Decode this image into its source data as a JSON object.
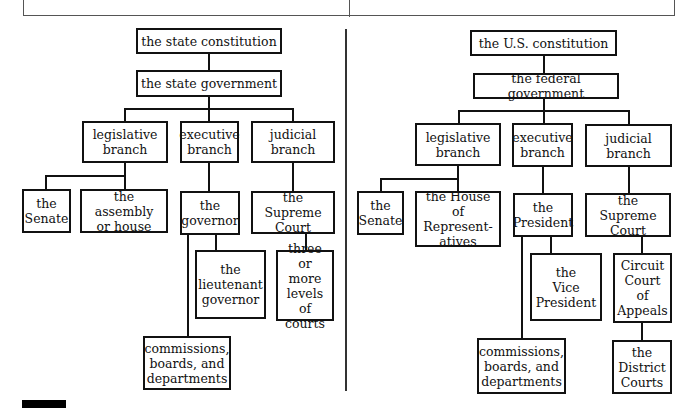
{
  "diagrams": {
    "state": {
      "constitution": "the state constitution",
      "government": "the state government",
      "legislative": "legislative\nbranch",
      "executive": "executive\nbranch",
      "judicial": "judicial\nbranch",
      "senate": "the\nSenate",
      "house": "the assembly\nor house",
      "chief": "the\ngovernor",
      "deputy": "the\nlieutenant\ngovernor",
      "commissions": "commissions,\nboards, and\ndepartments",
      "supreme": "the Supreme\nCourt",
      "lower_courts": "three\nor more\nlevels of\ncourts"
    },
    "federal": {
      "constitution": "the U.S. constitution",
      "government": "the federal government",
      "legislative": "legislative\nbranch",
      "executive": "executive\nbranch",
      "judicial": "judicial\nbranch",
      "senate": "the\nSenate",
      "house": "the House\nof Represent-\natives",
      "chief": "the\nPresident",
      "deputy": "the\nVice\nPresident",
      "commissions": "commissions,\nboards, and\ndepartments",
      "supreme": "the Supreme\nCourt",
      "appeals": "Circuit\nCourt\nof\nAppeals",
      "district": "the\nDistrict\nCourts"
    }
  }
}
